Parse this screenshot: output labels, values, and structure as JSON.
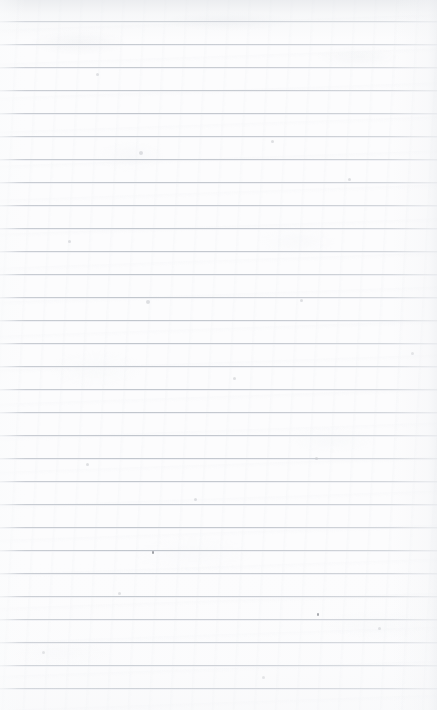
{
  "document": {
    "kind": "scanned-ruled-paper",
    "title": "Blank lined notebook page",
    "content_text": "",
    "has_handwriting": false,
    "has_printed_text": false,
    "width_px": 437,
    "height_px": 710
  },
  "paper": {
    "background_color": "#fcfcfd",
    "base_white": "#ffffff",
    "texture_description": "faint scan mottling and paper fibre banding",
    "edge_vignette": true,
    "top_edge_shade_color": "#dee1e5",
    "right_edge_shade_color": "#ebedf0"
  },
  "rules": {
    "label": "horizontal ruled lines",
    "color": "#c1c6cd",
    "thickness_px": 1,
    "spacing_px": 23,
    "first_line_y_px": 21,
    "count": 30,
    "line_y_positions": [
      21,
      44,
      67,
      90,
      113,
      136,
      159,
      182,
      205,
      228,
      251,
      274,
      297,
      320,
      343,
      366,
      389,
      412,
      435,
      458,
      481,
      504,
      527,
      550,
      573,
      596,
      619,
      642,
      665,
      688
    ],
    "margin_rule": false,
    "margin_rule_color": ""
  },
  "artifacts": {
    "label": "scan dust specks",
    "specks": [
      {
        "name": "speck-upper-center-left",
        "x": 152,
        "y": 551,
        "w": 2,
        "h": 3,
        "color": "#8e9196"
      },
      {
        "name": "speck-lower-right",
        "x": 317,
        "y": 613,
        "w": 2,
        "h": 3,
        "color": "#8e9196"
      }
    ],
    "soft_specks": [
      {
        "name": "soft-speck-a",
        "x": 96,
        "y": 73,
        "d": 3
      },
      {
        "name": "soft-speck-b",
        "x": 271,
        "y": 140,
        "d": 3
      },
      {
        "name": "soft-speck-c",
        "x": 139,
        "y": 151,
        "d": 4
      },
      {
        "name": "soft-speck-d",
        "x": 348,
        "y": 178,
        "d": 3
      },
      {
        "name": "soft-speck-e",
        "x": 68,
        "y": 240,
        "d": 3
      },
      {
        "name": "soft-speck-f",
        "x": 146,
        "y": 300,
        "d": 4
      },
      {
        "name": "soft-speck-g",
        "x": 300,
        "y": 299,
        "d": 3
      },
      {
        "name": "soft-speck-h",
        "x": 233,
        "y": 377,
        "d": 3
      },
      {
        "name": "soft-speck-i",
        "x": 411,
        "y": 352,
        "d": 3
      },
      {
        "name": "soft-speck-j",
        "x": 86,
        "y": 463,
        "d": 3
      },
      {
        "name": "soft-speck-k",
        "x": 315,
        "y": 457,
        "d": 3
      },
      {
        "name": "soft-speck-l",
        "x": 194,
        "y": 498,
        "d": 3
      },
      {
        "name": "soft-speck-m",
        "x": 118,
        "y": 592,
        "d": 3
      },
      {
        "name": "soft-speck-n",
        "x": 378,
        "y": 627,
        "d": 3
      },
      {
        "name": "soft-speck-o",
        "x": 42,
        "y": 651,
        "d": 3
      },
      {
        "name": "soft-speck-p",
        "x": 262,
        "y": 676,
        "d": 3
      }
    ]
  }
}
